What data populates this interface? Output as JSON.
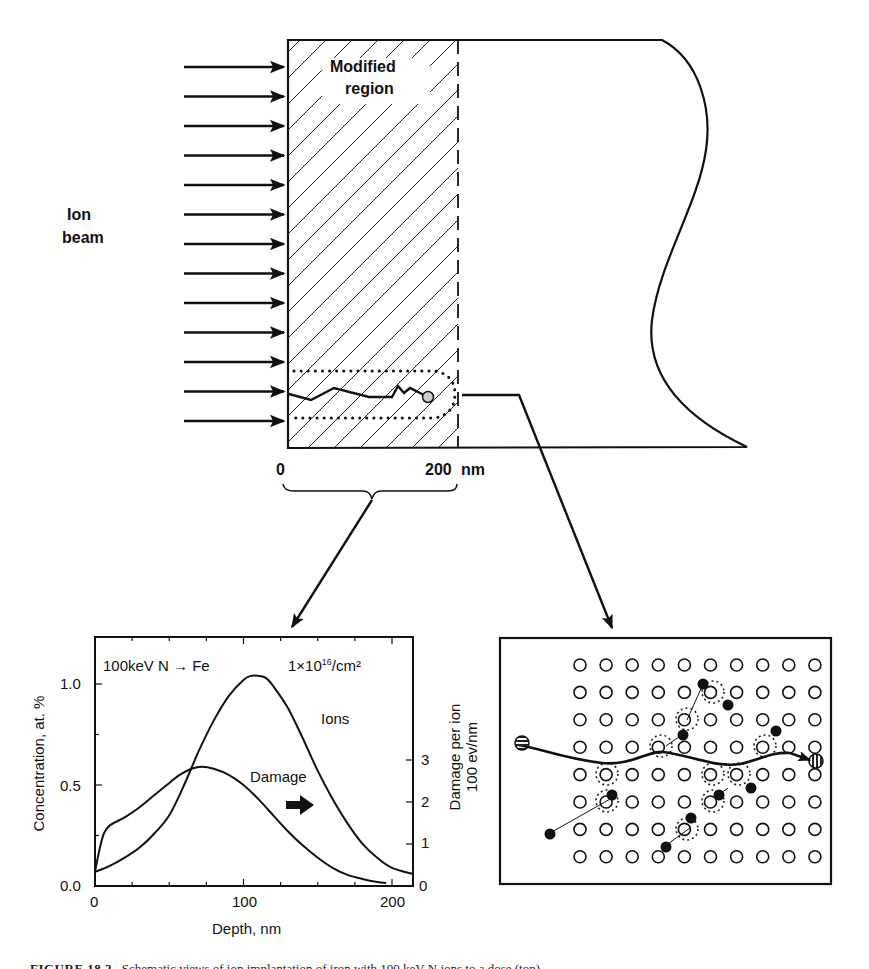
{
  "top_diagram": {
    "ion_beam_label_line1": "Ion",
    "ion_beam_label_line2": "beam",
    "region_label_line1": "Modified",
    "region_label_line2": "region",
    "depth_start_label": "0",
    "depth_end_label": "200",
    "depth_unit_label": "nm",
    "arrow_count": 13
  },
  "chart_data": {
    "type": "line",
    "title": "",
    "annotation_left": "100keV N → Fe",
    "annotation_right_prefix": "1×10",
    "annotation_right_exp": "16",
    "annotation_right_suffix": "/cm²",
    "xlabel": "Depth, nm",
    "ylabel": "Concentration, at. %",
    "ylabel2_line1": "Damage per ion",
    "ylabel2_line2": "100 ev/nm",
    "xlim": [
      0,
      214
    ],
    "ylim": [
      0,
      1.25
    ],
    "y2lim": [
      0,
      5.9
    ],
    "xticks": [
      "0",
      "100",
      "200"
    ],
    "yticks": [
      "0.0",
      "0.5",
      "1.0"
    ],
    "y2ticks": [
      "0",
      "1",
      "2",
      "3"
    ],
    "grid": false,
    "series": [
      {
        "name": "Ions",
        "label": "Ions",
        "x": [
          0,
          10,
          20,
          30,
          40,
          50,
          60,
          70,
          80,
          90,
          100,
          105,
          110,
          115,
          120,
          130,
          140,
          150,
          160,
          170,
          180,
          190,
          200,
          214
        ],
        "y": [
          0.07,
          0.1,
          0.14,
          0.19,
          0.26,
          0.35,
          0.5,
          0.67,
          0.82,
          0.94,
          1.02,
          1.04,
          1.04,
          1.03,
          0.99,
          0.88,
          0.73,
          0.57,
          0.43,
          0.31,
          0.21,
          0.14,
          0.09,
          0.06
        ]
      },
      {
        "name": "Damage",
        "label": "Damage",
        "x": [
          0,
          3,
          6,
          10,
          20,
          30,
          40,
          50,
          57,
          65,
          72,
          80,
          90,
          100,
          110,
          120,
          130,
          140,
          150,
          160,
          170,
          180,
          190,
          196
        ],
        "y": [
          0.07,
          0.18,
          0.26,
          0.3,
          0.34,
          0.39,
          0.45,
          0.51,
          0.55,
          0.58,
          0.59,
          0.58,
          0.55,
          0.5,
          0.43,
          0.35,
          0.27,
          0.2,
          0.14,
          0.09,
          0.055,
          0.035,
          0.02,
          0.015
        ]
      }
    ],
    "damage_axis_arrow": "right-arrow"
  },
  "lattice_diagram": {
    "rows": 8,
    "cols": 10,
    "incoming_ion": "striped-horizontal-circle",
    "stopped_ion": "striped-vertical-circle"
  },
  "caption": {
    "figure_label": "FIGURE 18.2",
    "text": "Schematic views of ion implantation of iron with 100 keV N ions to a dose (top)"
  }
}
